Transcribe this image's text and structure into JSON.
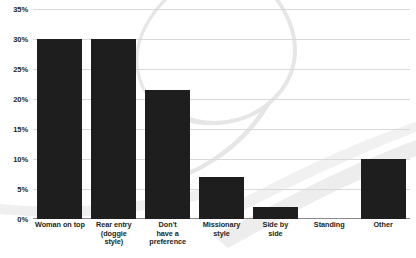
{
  "chart_data": {
    "type": "bar",
    "title": "",
    "xlabel": "",
    "ylabel": "",
    "ylim": [
      0,
      35
    ],
    "ytick_step": 5,
    "grid": true,
    "legend": "none",
    "categories": [
      "Woman on top",
      "Rear entry (doggie style)",
      "Don't have a preference",
      "Missionary style",
      "Side by side",
      "Standing",
      "Other"
    ],
    "category_lines": [
      [
        "Woman on top"
      ],
      [
        "Rear entry",
        "(doggie",
        "style)"
      ],
      [
        "Don't",
        "have a",
        "preference"
      ],
      [
        "Missionary",
        "style"
      ],
      [
        "Side by",
        "side"
      ],
      [
        "Standing"
      ],
      [
        "Other"
      ]
    ],
    "values": [
      30,
      30,
      21.5,
      7,
      2,
      0,
      10
    ],
    "value_labels": [
      "30%",
      "30%",
      "21.5%",
      "7%",
      "2%",
      "0%",
      "10%"
    ],
    "ytick_labels": [
      "0%",
      "5%",
      "10%",
      "15%",
      "20%",
      "25%",
      "30%",
      "35%"
    ],
    "ytick_values": [
      0,
      5,
      10,
      15,
      20,
      25,
      30,
      35
    ],
    "colors": {
      "bar": "#1e1e1e",
      "gridline": "#d9d9d9",
      "axis": "#8a8a8a",
      "text": "#231f20",
      "background": "#ffffff",
      "watermark": "#e8e8e8"
    }
  }
}
